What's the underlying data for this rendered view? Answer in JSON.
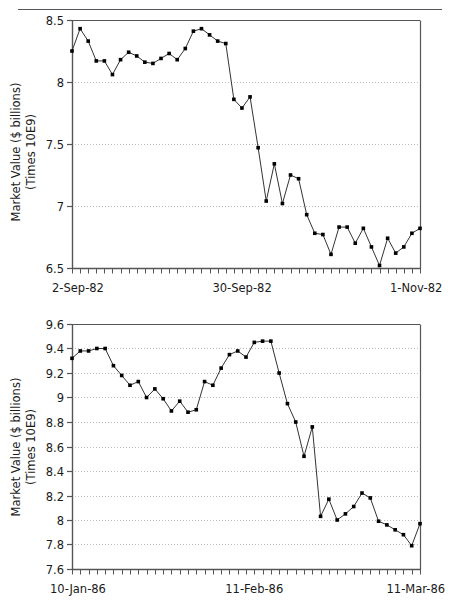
{
  "page": {
    "background": "#ffffff",
    "ink": "#1a1a1a",
    "rule_color": "#55585c",
    "axis_color": "#555555",
    "grid_color": "#bbbbbb",
    "marker_color": "#000000",
    "line_color": "#333333"
  },
  "chart_data": [
    {
      "id": "chart-top",
      "type": "line",
      "title": "",
      "xlabel": "",
      "ylabel": "Market Value ($ billions) (Times 10E9)",
      "ylabel_line1": "Market Value ($ billions)",
      "ylabel_line2": "(Times 10E9)",
      "ytick_labels": [
        "6.5",
        "7",
        "7.5",
        "8",
        "8.5"
      ],
      "ytick_values": [
        6.5,
        7,
        7.5,
        8,
        8.5
      ],
      "ylim": [
        6.5,
        8.5
      ],
      "grid": true,
      "grid_axis": "y",
      "legend": "none",
      "xtick_count": 44,
      "xtick_labels": [
        "2-Sep-82",
        "30-Sep-82",
        "1-Nov-82"
      ],
      "xtick_label_positions": [
        0,
        21,
        43
      ],
      "x": [
        0,
        1,
        2,
        3,
        4,
        5,
        6,
        7,
        8,
        9,
        10,
        11,
        12,
        13,
        14,
        15,
        16,
        17,
        18,
        19,
        20,
        21,
        22,
        23,
        24,
        25,
        26,
        27,
        28,
        29,
        30,
        31,
        32,
        33,
        34,
        35,
        36,
        37,
        38,
        39,
        40,
        41,
        42,
        43
      ],
      "values": [
        8.25,
        8.43,
        8.33,
        8.17,
        8.17,
        8.06,
        8.18,
        8.24,
        8.21,
        8.16,
        8.15,
        8.19,
        8.23,
        8.18,
        8.27,
        8.41,
        8.43,
        8.38,
        8.33,
        8.31,
        7.86,
        7.79,
        7.88,
        7.47,
        7.04,
        7.34,
        7.02,
        7.25,
        7.22,
        6.93,
        6.78,
        6.77,
        6.61,
        6.83,
        6.83,
        6.7,
        6.82,
        6.67,
        6.52,
        6.74,
        6.62,
        6.67,
        6.78,
        6.82
      ]
    },
    {
      "id": "chart-bottom",
      "type": "line",
      "title": "",
      "xlabel": "",
      "ylabel": "Market Value ($ billions) (Times 10E9)",
      "ylabel_line1": "Market Value ($ billions)",
      "ylabel_line2": "(Times 10E9)",
      "ytick_labels": [
        "7.6",
        "7.8",
        "8",
        "8.2",
        "8.4",
        "8.6",
        "8.8",
        "9",
        "9.2",
        "9.4",
        "9.6"
      ],
      "ytick_values": [
        7.6,
        7.8,
        8.0,
        8.2,
        8.4,
        8.6,
        8.8,
        9.0,
        9.2,
        9.4,
        9.6
      ],
      "ylim": [
        7.6,
        9.6
      ],
      "grid": true,
      "grid_axis": "y",
      "legend": "none",
      "xtick_count": 43,
      "xtick_labels": [
        "10-Jan-86",
        "11-Feb-86",
        "11-Mar-86"
      ],
      "xtick_label_positions": [
        0,
        22,
        42
      ],
      "x": [
        0,
        1,
        2,
        3,
        4,
        5,
        6,
        7,
        8,
        9,
        10,
        11,
        12,
        13,
        14,
        15,
        16,
        17,
        18,
        19,
        20,
        21,
        22,
        23,
        24,
        25,
        26,
        27,
        28,
        29,
        30,
        31,
        32,
        33,
        34,
        35,
        36,
        37,
        38,
        39,
        40,
        41,
        42
      ],
      "values": [
        9.32,
        9.38,
        9.38,
        9.4,
        9.4,
        9.26,
        9.18,
        9.1,
        9.13,
        9.0,
        9.07,
        8.99,
        8.89,
        8.97,
        8.88,
        8.9,
        9.13,
        9.1,
        9.24,
        9.35,
        9.38,
        9.33,
        9.45,
        9.46,
        9.46,
        9.2,
        8.95,
        8.8,
        8.52,
        8.76,
        8.03,
        8.17,
        8.0,
        8.05,
        8.11,
        8.22,
        8.18,
        7.99,
        7.96,
        7.92,
        7.88,
        7.79,
        7.97
      ]
    }
  ]
}
